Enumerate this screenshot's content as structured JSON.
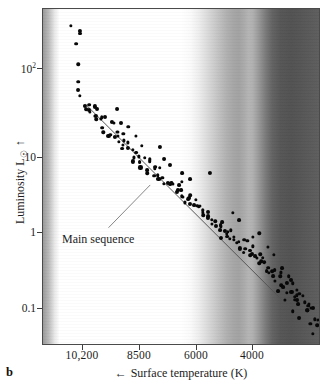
{
  "figure": {
    "panel_label": "b",
    "type": "scatter"
  },
  "axes": {
    "x": {
      "title_text": "Surface temperature (K)",
      "title_arrow": "←",
      "ticks": [
        {
          "label": "10,200",
          "value": 10200,
          "px": 82
        },
        {
          "label": "8500",
          "value": 8500,
          "px": 139
        },
        {
          "label": "6000",
          "value": 6000,
          "px": 196
        },
        {
          "label": "4000",
          "value": 4000,
          "px": 252
        }
      ],
      "direction": "decreasing"
    },
    "y": {
      "title_text": "Luminosity L",
      "title_symbol": "☉",
      "title_arrow": "↑",
      "scale": "log",
      "ticks": [
        {
          "label": "10",
          "sup": "2",
          "value": 100,
          "px": 68
        },
        {
          "label": "10",
          "sup": "",
          "value": 10,
          "px": 157
        },
        {
          "label": "1",
          "sup": "",
          "value": 1,
          "px": 232
        },
        {
          "label": "0.1",
          "sup": "",
          "value": 0.1,
          "px": 308
        }
      ]
    }
  },
  "annotations": [
    {
      "name": "main-sequence-label",
      "text": "Main sequence",
      "leader_line": {
        "x1": 108,
        "y1": 228,
        "x2": 150,
        "y2": 185
      }
    }
  ],
  "main_sequence_line": {
    "x1": 85,
    "y1": 104,
    "x2": 300,
    "y2": 318
  },
  "colors": {
    "ink": "#1a1a1a",
    "point": "#080808",
    "frame": "#4a4a4a",
    "background_hot": "#ffffff",
    "background_cool": "#525252"
  },
  "chart_data": {
    "type": "scatter",
    "title": "",
    "subtitle": "",
    "xlabel": "Surface temperature (K)",
    "ylabel": "Luminosity L☉",
    "xscale": "linear-reversed",
    "yscale": "log",
    "xlim": [
      11200,
      2700
    ],
    "ylim": [
      0.05,
      500
    ],
    "grid": false,
    "legend": null,
    "series": [
      {
        "name": "stars",
        "points": [
          [
            10300,
            330
          ],
          [
            10150,
            260
          ],
          [
            10050,
            230
          ],
          [
            10250,
            175
          ],
          [
            10200,
            115
          ],
          [
            10150,
            74
          ],
          [
            10100,
            56
          ],
          [
            10050,
            46
          ],
          [
            9950,
            40
          ],
          [
            9900,
            34
          ],
          [
            9850,
            38
          ],
          [
            9800,
            30
          ],
          [
            9750,
            36
          ],
          [
            9700,
            28
          ],
          [
            9650,
            33
          ],
          [
            9600,
            25
          ],
          [
            9550,
            30
          ],
          [
            9500,
            22
          ],
          [
            9450,
            27
          ],
          [
            9400,
            20
          ],
          [
            9350,
            26
          ],
          [
            9300,
            18
          ],
          [
            9250,
            24
          ],
          [
            9200,
            17
          ],
          [
            9150,
            21
          ],
          [
            9100,
            16
          ],
          [
            9050,
            20
          ],
          [
            9000,
            14
          ],
          [
            8950,
            18
          ],
          [
            8900,
            13
          ],
          [
            8850,
            16
          ],
          [
            8800,
            12
          ],
          [
            8750,
            15
          ],
          [
            8700,
            11
          ],
          [
            8650,
            14
          ],
          [
            8600,
            10
          ],
          [
            8550,
            12.5
          ],
          [
            8500,
            9.2
          ],
          [
            8450,
            11.5
          ],
          [
            8400,
            8.6
          ],
          [
            8350,
            10.5
          ],
          [
            8300,
            8.0
          ],
          [
            8250,
            9.6
          ],
          [
            8200,
            7.4
          ],
          [
            8150,
            11.0
          ],
          [
            8100,
            9.0
          ],
          [
            8050,
            6.8
          ],
          [
            8000,
            8.2
          ],
          [
            7950,
            6.2
          ],
          [
            7900,
            7.5
          ],
          [
            7850,
            5.8
          ],
          [
            7800,
            6.9
          ],
          [
            7750,
            5.4
          ],
          [
            7700,
            6.3
          ],
          [
            7650,
            5.0
          ],
          [
            7600,
            5.8
          ],
          [
            7550,
            4.6
          ],
          [
            7500,
            5.3
          ],
          [
            7450,
            4.3
          ],
          [
            7400,
            4.9
          ],
          [
            7350,
            4.0
          ],
          [
            7300,
            4.5
          ],
          [
            7250,
            3.7
          ],
          [
            7200,
            4.2
          ],
          [
            7150,
            3.4
          ],
          [
            7100,
            3.9
          ],
          [
            7050,
            3.2
          ],
          [
            7000,
            3.6
          ],
          [
            6950,
            2.9
          ],
          [
            6900,
            3.3
          ],
          [
            6850,
            2.7
          ],
          [
            6800,
            3.0
          ],
          [
            6750,
            2.5
          ],
          [
            6700,
            2.8
          ],
          [
            6650,
            2.3
          ],
          [
            6600,
            2.6
          ],
          [
            6550,
            2.1
          ],
          [
            6500,
            2.4
          ],
          [
            6450,
            2.0
          ],
          [
            6400,
            2.2
          ],
          [
            6350,
            1.85
          ],
          [
            6300,
            2.05
          ],
          [
            6250,
            1.7
          ],
          [
            6200,
            1.9
          ],
          [
            6150,
            1.6
          ],
          [
            6100,
            1.78
          ],
          [
            6050,
            1.48
          ],
          [
            6000,
            1.65
          ],
          [
            5950,
            1.38
          ],
          [
            5900,
            1.52
          ],
          [
            5850,
            1.28
          ],
          [
            5800,
            1.42
          ],
          [
            5750,
            1.18
          ],
          [
            5700,
            1.32
          ],
          [
            5650,
            1.1
          ],
          [
            5600,
            1.22
          ],
          [
            5550,
            1.02
          ],
          [
            5500,
            1.14
          ],
          [
            5450,
            0.95
          ],
          [
            5400,
            1.05
          ],
          [
            5350,
            0.88
          ],
          [
            5300,
            0.98
          ],
          [
            5250,
            0.82
          ],
          [
            5200,
            0.91
          ],
          [
            5150,
            0.76
          ],
          [
            5100,
            0.85
          ],
          [
            5050,
            0.7
          ],
          [
            5000,
            0.79
          ],
          [
            4950,
            0.65
          ],
          [
            4900,
            0.73
          ],
          [
            4850,
            0.6
          ],
          [
            4800,
            0.68
          ],
          [
            4750,
            0.56
          ],
          [
            4700,
            0.63
          ],
          [
            4650,
            0.52
          ],
          [
            4600,
            0.58
          ],
          [
            4550,
            0.48
          ],
          [
            4500,
            0.54
          ],
          [
            4450,
            0.45
          ],
          [
            4400,
            0.5
          ],
          [
            4350,
            0.41
          ],
          [
            4300,
            0.46
          ],
          [
            4250,
            0.38
          ],
          [
            4200,
            0.43
          ],
          [
            4150,
            0.35
          ],
          [
            4100,
            0.4
          ],
          [
            4050,
            0.32
          ],
          [
            4000,
            0.37
          ],
          [
            3950,
            0.29
          ],
          [
            3900,
            0.33
          ],
          [
            3850,
            0.27
          ],
          [
            3800,
            0.31
          ],
          [
            3750,
            0.24
          ],
          [
            3700,
            0.28
          ],
          [
            3650,
            0.22
          ],
          [
            3600,
            0.26
          ],
          [
            3550,
            0.2
          ],
          [
            3500,
            0.24
          ],
          [
            3450,
            0.185
          ],
          [
            3400,
            0.215
          ],
          [
            3350,
            0.17
          ],
          [
            3300,
            0.2
          ],
          [
            3250,
            0.155
          ],
          [
            3200,
            0.18
          ],
          [
            3150,
            0.14
          ],
          [
            3100,
            0.165
          ],
          [
            3050,
            0.13
          ],
          [
            3000,
            0.15
          ],
          [
            2950,
            0.115
          ],
          [
            2900,
            0.135
          ],
          [
            2850,
            0.105
          ],
          [
            2800,
            0.095
          ],
          [
            6050,
            5.3
          ],
          [
            5800,
            1.05
          ],
          [
            4650,
            1.0
          ],
          [
            4350,
            0.72
          ],
          [
            7000,
            6.1
          ],
          [
            6700,
            5.1
          ],
          [
            5450,
            2.0
          ],
          [
            5150,
            1.45
          ],
          [
            4850,
            0.95
          ],
          [
            4200,
            0.6
          ],
          [
            3900,
            0.42
          ],
          [
            3650,
            0.33
          ],
          [
            3400,
            0.155
          ],
          [
            3150,
            0.12
          ],
          [
            2950,
            0.088
          ],
          [
            2880,
            0.075
          ],
          [
            9000,
            30
          ],
          [
            8800,
            22
          ],
          [
            8600,
            19
          ],
          [
            8400,
            17
          ],
          [
            7700,
            10.5
          ],
          [
            7500,
            8.8
          ],
          [
            7300,
            7.2
          ],
          [
            6900,
            4.6
          ],
          [
            4050,
            0.23
          ],
          [
            3800,
            0.165
          ],
          [
            3550,
            0.135
          ],
          [
            3300,
            0.115
          ]
        ]
      }
    ],
    "annotations": [
      {
        "text": "Main sequence",
        "type": "label-with-leader"
      }
    ]
  }
}
